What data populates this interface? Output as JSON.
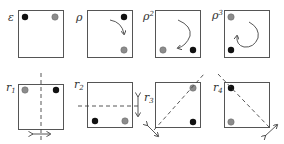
{
  "colors": {
    "black_dot": "#111111",
    "gray_dot": "#8c8c8c",
    "box_stroke": "#555555",
    "arrow": "#444444"
  },
  "rotations": [
    {
      "label": "ε",
      "sup": "",
      "black": "top-left",
      "gray": "top-right",
      "arrow": "none"
    },
    {
      "label": "ρ",
      "sup": "",
      "black": "top-right",
      "gray": "bottom-right",
      "arrow": "quarter-turn"
    },
    {
      "label": "ρ",
      "sup": "2",
      "black": "bottom-right",
      "gray": "bottom-left",
      "arrow": "half-turn"
    },
    {
      "label": "ρ",
      "sup": "3",
      "black": "bottom-left",
      "gray": "top-left",
      "arrow": "three-quarter-turn"
    }
  ],
  "reflections": [
    {
      "label": "r",
      "sub": "1",
      "black": "top-right",
      "gray": "top-left",
      "axis": "vertical"
    },
    {
      "label": "r",
      "sub": "2",
      "black": "bottom-left",
      "gray": "bottom-right",
      "axis": "horizontal"
    },
    {
      "label": "r",
      "sub": "3",
      "black": "bottom-right",
      "gray": "top-right",
      "axis": "diagonal-up"
    },
    {
      "label": "r",
      "sub": "4",
      "black": "top-left",
      "gray": "bottom-left",
      "axis": "diagonal-down"
    }
  ]
}
